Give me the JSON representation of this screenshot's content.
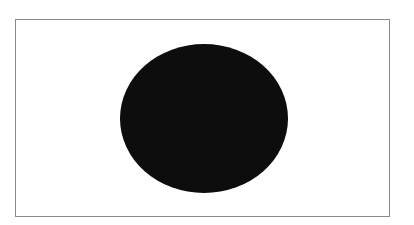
{
  "figure": {
    "frame": {
      "border_color": "#8a8a8a",
      "fill_color": "#ffffff"
    },
    "disc": {
      "shape": "ellipse",
      "fill_color": "#0d0d0d"
    }
  }
}
